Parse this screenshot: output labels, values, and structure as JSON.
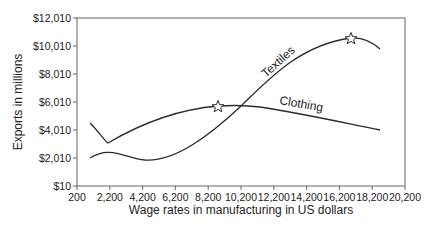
{
  "chart_data": {
    "type": "line",
    "title": "",
    "xlabel": "Wage rates in manufacturing in US dollars",
    "ylabel": "Exports in millions",
    "xlim": [
      200,
      20200
    ],
    "ylim": [
      10,
      12010
    ],
    "x_ticks": [
      "200",
      "2,200",
      "4,200",
      "6,200",
      "8,200",
      "10,200",
      "12,200",
      "14,200",
      "16,200",
      "18,200",
      "20,200"
    ],
    "y_ticks": [
      "$10",
      "$2,010",
      "$4,010",
      "$6,010",
      "$8,010",
      "$10,010",
      "$12,010"
    ],
    "grid": false,
    "legend": "inline curve labels",
    "series": [
      {
        "name": "Textiles",
        "points": [
          {
            "x": 990,
            "y": 2010
          },
          {
            "x": 2090,
            "y": 3080
          },
          {
            "x": 4220,
            "y": 1870
          },
          {
            "x": 7000,
            "y": 3000
          },
          {
            "x": 10140,
            "y": 5650
          },
          {
            "x": 13000,
            "y": 8400
          },
          {
            "x": 16900,
            "y": 10580
          },
          {
            "x": 18680,
            "y": 9800
          }
        ],
        "marker": {
          "x": 16900,
          "y": 10580,
          "shape": "star"
        }
      },
      {
        "name": "Clothing",
        "points": [
          {
            "x": 990,
            "y": 4510
          },
          {
            "x": 2090,
            "y": 3080
          },
          {
            "x": 4220,
            "y": 4400
          },
          {
            "x": 8800,
            "y": 5720
          },
          {
            "x": 10140,
            "y": 5650
          },
          {
            "x": 14000,
            "y": 5000
          },
          {
            "x": 18680,
            "y": 4010
          }
        ],
        "marker": {
          "x": 8800,
          "y": 5720,
          "shape": "star"
        }
      }
    ]
  },
  "labels": {
    "xlabel": "Wage rates in manufacturing in US dollars",
    "ylabel": "Exports in millions",
    "textiles": "Textiles",
    "clothing": "Clothing"
  },
  "colors": {
    "line": "#2a2a2a",
    "axis": "#555555"
  }
}
